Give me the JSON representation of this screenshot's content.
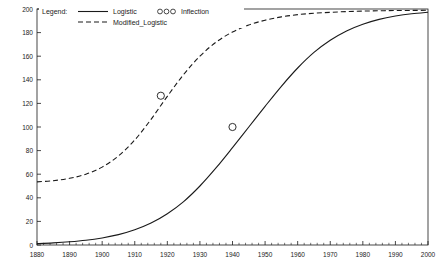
{
  "chart_data": {
    "type": "line",
    "title": "",
    "xlabel": "",
    "ylabel": "",
    "xlim": [
      1880,
      2000
    ],
    "ylim": [
      0,
      200
    ],
    "grid": false,
    "xticks": [
      "1880",
      "1890",
      "1900",
      "1910",
      "1920",
      "1930",
      "1940",
      "1950",
      "1960",
      "1970",
      "1980",
      "1990",
      "2000"
    ],
    "yticks": [
      "0",
      "20",
      "40",
      "60",
      "80",
      "100",
      "120",
      "140",
      "160",
      "180",
      "200"
    ],
    "legend": {
      "title": "Legend:",
      "position": "top-left",
      "entries": [
        {
          "label": "Logistic",
          "style": "solid"
        },
        {
          "label": "Modified_Logistic",
          "style": "dashed"
        },
        {
          "label": "Inflection",
          "style": "marker-circles"
        }
      ]
    },
    "series": [
      {
        "name": "Logistic",
        "style": "solid",
        "x": [
          1880,
          1885,
          1890,
          1895,
          1900,
          1905,
          1910,
          1915,
          1920,
          1925,
          1930,
          1935,
          1940,
          1945,
          1950,
          1955,
          1960,
          1965,
          1970,
          1975,
          1980,
          1985,
          1990,
          1995,
          2000
        ],
        "y": [
          1.2,
          1.8,
          2.7,
          4.0,
          6.0,
          8.8,
          12.9,
          18.6,
          26.5,
          36.8,
          50.0,
          65.5,
          82.5,
          100.0,
          117.5,
          134.5,
          150.0,
          163.2,
          173.5,
          181.4,
          187.1,
          191.2,
          194.0,
          196.0,
          197.3
        ]
      },
      {
        "name": "Modified_Logistic",
        "style": "dashed",
        "x": [
          1880,
          1885,
          1890,
          1895,
          1900,
          1905,
          1910,
          1915,
          1920,
          1925,
          1930,
          1935,
          1940,
          1945,
          1950,
          1955,
          1960,
          1965,
          1970,
          1975,
          1980,
          1985,
          1990,
          1995,
          2000
        ],
        "y": [
          53.5,
          54.5,
          56.5,
          60.0,
          66.0,
          75.5,
          89.0,
          106.5,
          126.0,
          144.5,
          160.0,
          172.0,
          180.5,
          186.5,
          190.5,
          193.3,
          195.2,
          196.4,
          197.2,
          197.8,
          198.2,
          198.5,
          198.7,
          198.8,
          198.9
        ]
      }
    ],
    "inflection_points": [
      {
        "series": "Modified_Logistic",
        "x": 1918,
        "y": 126.5
      },
      {
        "series": "Logistic",
        "x": 1940,
        "y": 100.0
      }
    ]
  }
}
